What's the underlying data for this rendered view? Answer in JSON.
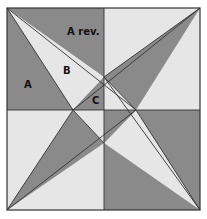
{
  "diagram": {
    "type": "quilt-block",
    "colors": {
      "dark": "#8a8a8a",
      "light": "#e6e6e6",
      "line": "#333333",
      "background": "#ffffff"
    },
    "labels": {
      "a_rev": "A rev.",
      "a": "A",
      "b": "B",
      "c": "C"
    }
  }
}
